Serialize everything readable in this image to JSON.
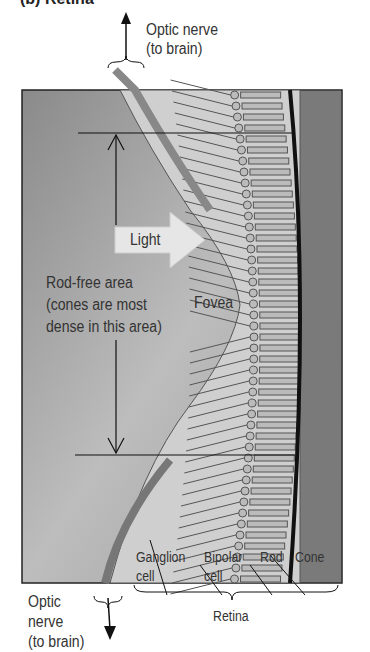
{
  "title": "(b) Retina",
  "labels": {
    "optic_nerve_top": [
      "Optic nerve",
      "(to brain)"
    ],
    "light": "Light",
    "rod_free": [
      "Rod-free area",
      "(cones are most",
      "dense in this area)"
    ],
    "fovea": "Fovea",
    "optic_nerve_bottom": [
      "Optic",
      "nerve",
      "(to brain)"
    ],
    "ganglion": [
      "Ganglion",
      "cell"
    ],
    "bipolar": [
      "Bipolar",
      "cell"
    ],
    "rod": "Rod",
    "cone": "Cone",
    "retina": "Retina"
  },
  "colors": {
    "background": "#8c8c8c",
    "tissue": "#c8c8c8",
    "pigment": "#6e6e6e"
  }
}
